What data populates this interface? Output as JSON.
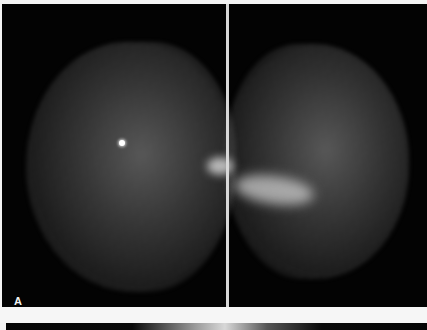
{
  "figure": {
    "panel_label": "A",
    "colors": {
      "background": "#030303",
      "divider": "#d8d8d8",
      "page": "#f4f4f4",
      "label": "#f2f2f2"
    },
    "views": [
      {
        "name": "left-view",
        "finding": "bright punctate calcification"
      },
      {
        "name": "right-view",
        "finding": "dense stellate region"
      }
    ]
  }
}
